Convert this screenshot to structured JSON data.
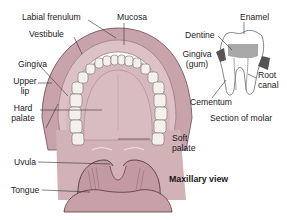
{
  "diagram": {
    "view_label": "Maxillary view",
    "molar_caption": "Section of molar",
    "mouth_labels": {
      "labial_frenulum": "Labial frenulum",
      "mucosa": "Mucosa",
      "vestibule": "Vestibule",
      "gingiva": "Gingiva",
      "upper_lip_1": "Upper",
      "upper_lip_2": "lip",
      "hard_palate_1": "Hard",
      "hard_palate_2": "palate",
      "soft_palate_1": "Soft",
      "soft_palate_2": "palate",
      "uvula": "Uvula",
      "tongue": "Tongue"
    },
    "molar_labels": {
      "enamel": "Enamel",
      "dentine": "Dentine",
      "gingiva_1": "Gingiva",
      "gingiva_2": "(gum)",
      "root_canal_1": "Root",
      "root_canal_2": "canal",
      "cementum": "Cementum"
    },
    "colors": {
      "lip": "#c9a3ab",
      "mucosa": "#dcc1c6",
      "palate": "#d6b9be",
      "throat": "#c39aa1",
      "teeth": "#f4f1ec",
      "dentine": "#a8a8a8",
      "gum": "#555555"
    }
  }
}
